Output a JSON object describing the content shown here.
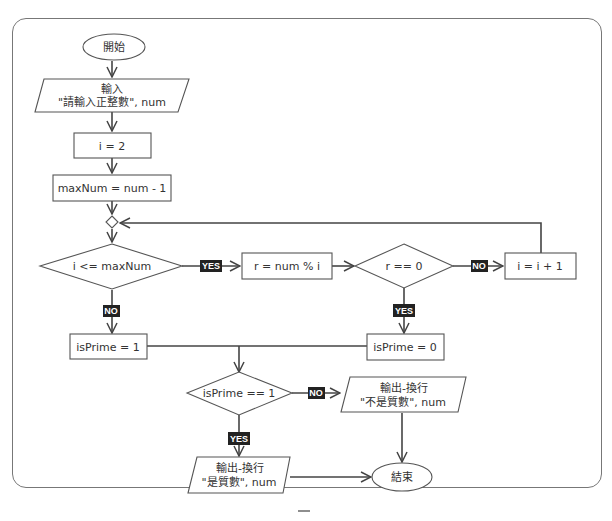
{
  "flowchart": {
    "start": "開始",
    "input": {
      "line1": "輸入",
      "line2": "\"請輸入正整數\", num"
    },
    "assign_i": "i = 2",
    "assign_max": "maxNum = num - 1",
    "cond_loop": "i <= maxNum",
    "calc_r": "r = num % i",
    "cond_r": "r == 0",
    "increment": "i = i + 1",
    "set_prime_1": "isPrime = 1",
    "set_prime_0": "isPrime = 0",
    "cond_prime": "isPrime == 1",
    "output_not_prime": {
      "line1": "輸出-換行",
      "line2": "\"不是質數\", num"
    },
    "output_prime": {
      "line1": "輸出-換行",
      "line2": "\"是質數\", num"
    },
    "end": "結束"
  },
  "labels": {
    "yes": "YES",
    "no": "NO"
  },
  "colors": {
    "stroke": "#444444",
    "label_bg": "#222222",
    "frame": "#777777"
  },
  "footer_mark": "一"
}
